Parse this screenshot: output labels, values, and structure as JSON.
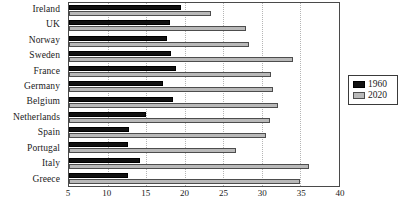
{
  "chart_data": {
    "type": "bar",
    "orientation": "horizontal",
    "title": "",
    "xlabel": "",
    "ylabel": "",
    "xlim": [
      5,
      40
    ],
    "xticks": [
      5,
      10,
      15,
      20,
      25,
      30,
      35,
      40
    ],
    "grid": true,
    "legend_position": "right",
    "categories": [
      "Ireland",
      "UK",
      "Norway",
      "Sweden",
      "France",
      "Germany",
      "Belgium",
      "Netherlands",
      "Spain",
      "Portugal",
      "Italy",
      "Greece"
    ],
    "series": [
      {
        "name": "1960",
        "color": "#111111",
        "values": [
          19.5,
          18.1,
          17.7,
          18.2,
          18.9,
          17.2,
          18.5,
          15.0,
          12.8,
          12.7,
          14.2,
          12.6
        ]
      },
      {
        "name": "2020",
        "color": "#b9b9b9",
        "values": [
          23.4,
          28.0,
          28.3,
          34.0,
          31.2,
          31.5,
          32.1,
          31.0,
          30.5,
          26.7,
          36.1,
          34.9
        ]
      }
    ]
  }
}
